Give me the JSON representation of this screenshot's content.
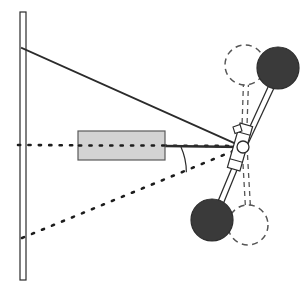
{
  "figure": {
    "width": 306,
    "height": 291,
    "background": "#ffffff"
  },
  "colors": {
    "stroke": "#2b2b2b",
    "wheel_fill": "#3a3a3a",
    "wheel_outline": "#2b2b2b",
    "rack_fill": "#d3d3d3",
    "rack_outline": "#5a5a5a",
    "dashed_stroke": "#555555",
    "dotted_stroke": "#1d1d1d",
    "joint_fill": "#ffffff",
    "background": "#ffffff"
  },
  "wall": {
    "label": "vehicle body reference wall",
    "x": 20,
    "y_top": 12,
    "y_bottom": 280,
    "thickness": 6
  },
  "centerline": {
    "label": "horizontal vehicle centreline",
    "style": "dotted",
    "x1": 18,
    "y1": 145,
    "x2": 243,
    "y2": 146
  },
  "tie_rod_line": {
    "label": "solid tie-rod / track-rod line",
    "style": "solid",
    "x1": 22,
    "y1": 48,
    "x2": 243,
    "y2": 147
  },
  "lower_projection_line": {
    "label": "dotted lower projection line",
    "style": "dotted",
    "x1": 22,
    "y1": 238,
    "x2": 243,
    "y2": 147
  },
  "rack": {
    "label": "steering rack housing",
    "x": 78,
    "y": 131,
    "width": 87,
    "height": 29
  },
  "rack_rod": {
    "label": "rack output rod",
    "x1": 165,
    "y1": 146,
    "x2": 243,
    "y2": 147
  },
  "angle_arc": {
    "label": "steer angle between centreline and tie-rod",
    "vertex_x": 243,
    "vertex_y": 147,
    "radius": 62,
    "start_angle_deg": 180,
    "sweep_deg": 24
  },
  "pivot": {
    "label": "kingpin pivot joint",
    "cx": 243,
    "cy": 147,
    "r": 6
  },
  "knuckle_block": {
    "label": "steering knuckle bracket",
    "cx": 240,
    "cy": 147,
    "width": 13,
    "height": 46,
    "rotation_deg": 16
  },
  "wheels": [
    {
      "name": "upper-wheel-turned",
      "state": "turned",
      "style": "filled",
      "cx": 278,
      "cy": 68,
      "r": 21
    },
    {
      "name": "upper-wheel-straight",
      "state": "straight-ahead",
      "style": "dashed",
      "cx": 245,
      "cy": 65,
      "r": 20
    },
    {
      "name": "lower-wheel-turned",
      "state": "turned",
      "style": "filled",
      "cx": 212,
      "cy": 220,
      "r": 21
    },
    {
      "name": "lower-wheel-straight",
      "state": "straight-ahead",
      "style": "dashed",
      "cx": 248,
      "cy": 225,
      "r": 20
    }
  ],
  "axles": [
    {
      "name": "upper-axle-turned",
      "style": "solid-double",
      "x1": 244,
      "y1": 143,
      "x2": 272,
      "y2": 84
    },
    {
      "name": "upper-axle-straight",
      "style": "dashed-double",
      "x1": 243,
      "y1": 140,
      "x2": 245,
      "y2": 82
    },
    {
      "name": "lower-axle-turned",
      "style": "solid-double",
      "x1": 242,
      "y1": 152,
      "x2": 221,
      "y2": 205
    },
    {
      "name": "lower-axle-straight",
      "style": "dashed-double",
      "x1": 244,
      "y1": 154,
      "x2": 247,
      "y2": 207
    }
  ],
  "chart_data": {
    "type": "diagram",
    "elements": [
      "vertical reference wall",
      "horizontal dotted centreline",
      "solid tie-rod line from wall to pivot",
      "dotted lower projection line from wall to pivot",
      "steering rack housing",
      "kingpin pivot joint",
      "two filled wheels in turned position",
      "two dashed wheels in straight-ahead position",
      "steer angle arc at pivot"
    ]
  }
}
